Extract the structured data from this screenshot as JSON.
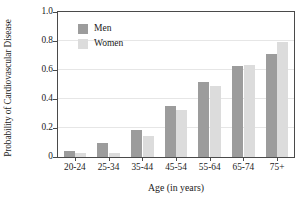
{
  "chart_data": {
    "type": "bar",
    "title": "",
    "subtitle": "",
    "xlabel": "Age (in years)",
    "ylabel": "Probability of Cardiovascular Disease",
    "categories": [
      "20-24",
      "25-34",
      "35-44",
      "45-54",
      "55-64",
      "65-74",
      "75+"
    ],
    "series": [
      {
        "name": "Men",
        "color": "#9c9c9c",
        "values": [
          0.04,
          0.1,
          0.185,
          0.355,
          0.52,
          0.63,
          0.71
        ]
      },
      {
        "name": "Women",
        "color": "#dcdcdc",
        "values": [
          0.025,
          0.025,
          0.145,
          0.325,
          0.49,
          0.635,
          0.79
        ]
      }
    ],
    "ylim": [
      0,
      1.0
    ],
    "ytick_labels": [
      "0",
      "0.2",
      "0.4",
      "0.6",
      "0.8",
      "1.0"
    ],
    "ytick_values": [
      0,
      0.2,
      0.4,
      0.6,
      0.8,
      1.0
    ],
    "grid": "horizontal",
    "legend_position": "top-left-inside"
  },
  "legend": {
    "items": [
      {
        "label": "Men"
      },
      {
        "label": "Women"
      }
    ]
  },
  "axes": {
    "y_title": "Probability of Cardiovascular Disease",
    "x_title": "Age (in years)"
  }
}
